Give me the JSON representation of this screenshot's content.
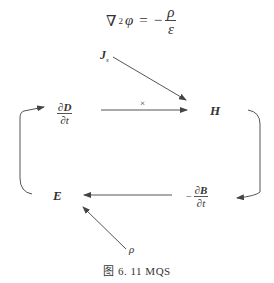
{
  "equation": {
    "lhs_operator": "∇",
    "lhs_power": "2",
    "lhs_var": "φ",
    "equals": "=",
    "sign": "−",
    "numerator": "ρ",
    "denominator": "ε"
  },
  "nodes": {
    "js": {
      "label": "J",
      "subscript": "s"
    },
    "dD_dt": {
      "num_prefix": "∂",
      "num_var": "D",
      "den": "∂t"
    },
    "H": {
      "label": "H"
    },
    "E": {
      "label": "E"
    },
    "dB_dt": {
      "sign": "−",
      "num_prefix": "∂",
      "num_var": "B",
      "den": "∂t"
    },
    "rho": {
      "label": "ρ"
    }
  },
  "edges": [
    {
      "from": "Js",
      "to": "H"
    },
    {
      "from": "∂D/∂t",
      "to": "H",
      "label": "×"
    },
    {
      "from": "H",
      "to": "−∂B/∂t"
    },
    {
      "from": "−∂B/∂t",
      "to": "E"
    },
    {
      "from": "ρ",
      "to": "E"
    },
    {
      "from": "E",
      "to": "∂D/∂t"
    }
  ],
  "caption": "图 6. 11    MQS"
}
